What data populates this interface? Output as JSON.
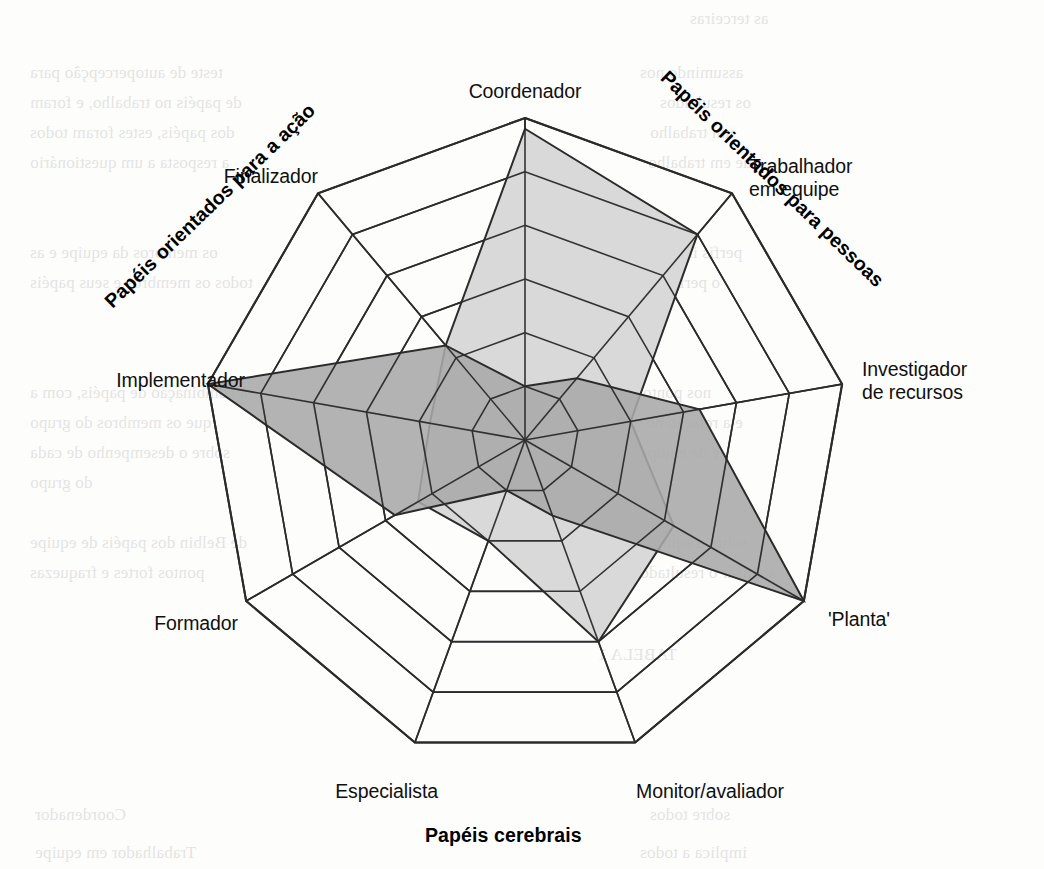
{
  "figure": {
    "axis_labels": [
      "Coordenador",
      "Trabalhador\nem equipe",
      "Investigador\nde recursos",
      "'Planta'",
      "Monitor/avaliador",
      "Especialista",
      "Formador",
      "Implementador",
      "Finalizador"
    ],
    "group_labels": {
      "people": "Papéis orientados para pessoas",
      "cerebral": "Papéis cerebrais",
      "action": "Papéis orientados para a ação"
    },
    "colors": {
      "grid_line": "#2b2b2b",
      "series_light_fill": "#d9d9d9",
      "series_dark_fill": "#a9a9a9",
      "series_stroke": "#2b2b2b",
      "background": "#fdfdfc"
    },
    "ghost_text": [
      {
        "x": 690,
        "y": 4,
        "t": "as terceiras"
      },
      {
        "x": 30,
        "y": 58,
        "t": "teste de autopercepção para"
      },
      {
        "x": 640,
        "y": 58,
        "t": "assumindo nos"
      },
      {
        "x": 30,
        "y": 88,
        "t": "de papéis no trabalho, e foram"
      },
      {
        "x": 660,
        "y": 88,
        "t": "os resultados"
      },
      {
        "x": 30,
        "y": 118,
        "t": "dos papéis, estes foram todos"
      },
      {
        "x": 650,
        "y": 118,
        "t": "um trabalho"
      },
      {
        "x": 30,
        "y": 148,
        "t": "a resposta a um questionário"
      },
      {
        "x": 648,
        "y": 148,
        "t": "que em trabalho"
      },
      {
        "x": 30,
        "y": 238,
        "t": "os membros da equipe e as"
      },
      {
        "x": 620,
        "y": 238,
        "t": "perfis individuais"
      },
      {
        "x": 30,
        "y": 268,
        "t": "todos os membros e seus papéis"
      },
      {
        "x": 648,
        "y": 268,
        "t": "o perfil da"
      },
      {
        "x": 30,
        "y": 378,
        "t": "a combinação de papéis, com a"
      },
      {
        "x": 636,
        "y": 378,
        "t": "nos pontos"
      },
      {
        "x": 30,
        "y": 408,
        "t": "que os membros do grupo"
      },
      {
        "x": 646,
        "y": 408,
        "t": "e a relação no"
      },
      {
        "x": 30,
        "y": 438,
        "t": "sobre o desempenho de cada"
      },
      {
        "x": 640,
        "y": 438,
        "t": "e de equipe"
      },
      {
        "x": 30,
        "y": 468,
        "t": "do grupo"
      },
      {
        "x": 30,
        "y": 528,
        "t": "de Belbin dos papéis de equipe"
      },
      {
        "x": 646,
        "y": 528,
        "t": "sobre a equipe"
      },
      {
        "x": 30,
        "y": 558,
        "t": "pontos fortes e fraquezas"
      },
      {
        "x": 640,
        "y": 558,
        "t": "analisar o resultado"
      },
      {
        "x": 598,
        "y": 640,
        "t": "TABELA 1"
      },
      {
        "x": 35,
        "y": 800,
        "t": "Coordenador"
      },
      {
        "x": 650,
        "y": 800,
        "t": "sobre todos"
      },
      {
        "x": 35,
        "y": 838,
        "t": "Trabalhador em equipe"
      },
      {
        "x": 640,
        "y": 838,
        "t": "implica a todos"
      }
    ]
  },
  "chart_data": {
    "type": "radar",
    "title": "",
    "categories": [
      "Coordenador",
      "Trabalhador em equipe",
      "Investigador de recursos",
      "'Planta'",
      "Monitor/avaliador",
      "Especialista",
      "Formador",
      "Implementador",
      "Finalizador"
    ],
    "rings": 6,
    "rlim": [
      0,
      6
    ],
    "grid": true,
    "legend_position": "none",
    "series": [
      {
        "name": "Perfil claro",
        "fill": "#d9d9d9",
        "values": [
          5.8,
          5.0,
          2.0,
          3.2,
          4.0,
          2.0,
          2.3,
          1.8,
          2.3
        ]
      },
      {
        "name": "Perfil escuro",
        "fill": "#a9a9a9",
        "values": [
          1.0,
          1.5,
          3.3,
          6.0,
          1.5,
          1.0,
          2.8,
          6.0,
          2.3
        ]
      }
    ],
    "annotations": [
      "Papéis orientados para pessoas",
      "Papéis cerebrais",
      "Papéis orientados para a ação"
    ]
  }
}
